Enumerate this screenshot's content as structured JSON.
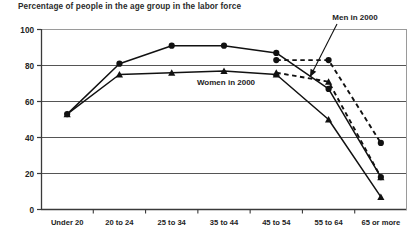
{
  "chart_data": {
    "type": "line",
    "title": "Percentage of people in the age group in the labor force",
    "xlabel": "",
    "ylabel": "",
    "ylim": [
      0,
      100
    ],
    "yticks": [
      0,
      20,
      40,
      60,
      80,
      100
    ],
    "grid": true,
    "legend_position": "inline-annotations",
    "categories": [
      "Under 20",
      "20 to 24",
      "25 to 34",
      "35 to 44",
      "45 to 54",
      "55 to 64",
      "65 or more"
    ],
    "series": [
      {
        "name": "Men in 2000",
        "marker": "circle",
        "line": "dashed",
        "values": [
          null,
          null,
          null,
          null,
          83,
          83,
          37
        ]
      },
      {
        "name": "Men (solid)",
        "marker": "circle",
        "line": "solid",
        "values": [
          53,
          81,
          91,
          91,
          87,
          67,
          18
        ]
      },
      {
        "name": "Women in 2000",
        "marker": "triangle",
        "line": "dashed",
        "values": [
          null,
          null,
          null,
          null,
          76,
          71,
          18
        ]
      },
      {
        "name": "Women (solid)",
        "marker": "triangle",
        "line": "solid",
        "values": [
          53,
          75,
          76,
          77,
          75,
          50,
          7
        ]
      }
    ],
    "annotations": [
      {
        "text": "Men in 2000",
        "x": 355,
        "y": 20,
        "leader_to_x": 310,
        "leader_to_y": 77
      },
      {
        "text": "Women in 2000",
        "x": 226,
        "y": 85,
        "leader_to_x": null,
        "leader_to_y": null
      }
    ]
  },
  "caption": {
    "text": ""
  }
}
